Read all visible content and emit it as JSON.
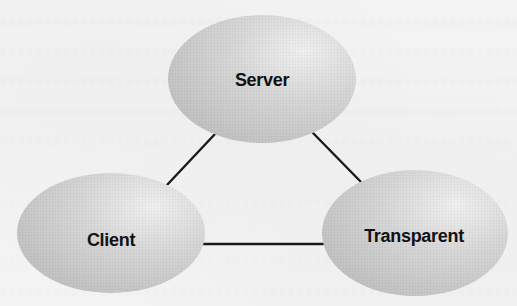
{
  "diagram": {
    "type": "triangle-network",
    "colors": {
      "background": "#f3f3f3",
      "node_fill_dark": "#c4c4c4",
      "node_fill_light": "#eeeeee",
      "edge": "#1a1a1a",
      "label": "#111111"
    },
    "nodes": [
      {
        "id": "server",
        "label": "Server",
        "cx": 262,
        "cy": 79,
        "rx": 94,
        "ry": 64,
        "label_x": 262,
        "label_y": 86
      },
      {
        "id": "client",
        "label": "Client",
        "cx": 111,
        "cy": 233,
        "rx": 94,
        "ry": 60,
        "label_x": 111,
        "label_y": 246
      },
      {
        "id": "transparent",
        "label": "Transparent",
        "cx": 415,
        "cy": 233,
        "rx": 93,
        "ry": 63,
        "label_x": 414,
        "label_y": 242
      }
    ],
    "edges": [
      {
        "from": "server",
        "to": "client",
        "x1": 215,
        "y1": 134,
        "x2": 167,
        "y2": 185
      },
      {
        "from": "server",
        "to": "transparent",
        "x1": 313,
        "y1": 133,
        "x2": 361,
        "y2": 182
      },
      {
        "from": "client",
        "to": "transparent",
        "x1": 203,
        "y1": 244,
        "x2": 323,
        "y2": 244
      }
    ]
  }
}
